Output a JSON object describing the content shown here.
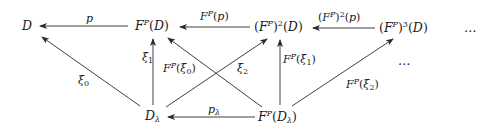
{
  "diagram": {
    "type": "commutative-diagram",
    "nodes": {
      "D": "D",
      "FD": "F^P(D)",
      "F2D": "(F^P)^2(D)",
      "F3D": "(F^P)^3(D)",
      "dots_top": "…",
      "dots_mid": "…",
      "Dl": "D_λ",
      "FDl": "F^P(D_λ)"
    },
    "edges": [
      {
        "from": "FD",
        "to": "D",
        "label": "p"
      },
      {
        "from": "F2D",
        "to": "FD",
        "label": "F^P(p)"
      },
      {
        "from": "F3D",
        "to": "F2D",
        "label": "(F^P)^2(p)"
      },
      {
        "from": "Dl",
        "to": "D",
        "label": "ξ_0"
      },
      {
        "from": "Dl",
        "to": "FD",
        "label": "ξ_1"
      },
      {
        "from": "Dl",
        "to": "F2D",
        "label": "ξ_2"
      },
      {
        "from": "FDl",
        "to": "FD",
        "label": "F^P(ξ_0)"
      },
      {
        "from": "FDl",
        "to": "F2D",
        "label": "F^P(ξ_1)"
      },
      {
        "from": "FDl",
        "to": "F3D",
        "label": "F^P(ξ_2)"
      },
      {
        "from": "FDl",
        "to": "Dl",
        "label": "p_λ"
      }
    ],
    "glyphs": {
      "F": "F",
      "P": "P",
      "D": "D",
      "p": "p",
      "xi": "ξ",
      "lambda": "λ",
      "sq": "2",
      "cube": "3",
      "zero": "0",
      "one": "1",
      "two": "2",
      "lparen": "(",
      "rparen": ")",
      "ellipsis": "…"
    }
  }
}
